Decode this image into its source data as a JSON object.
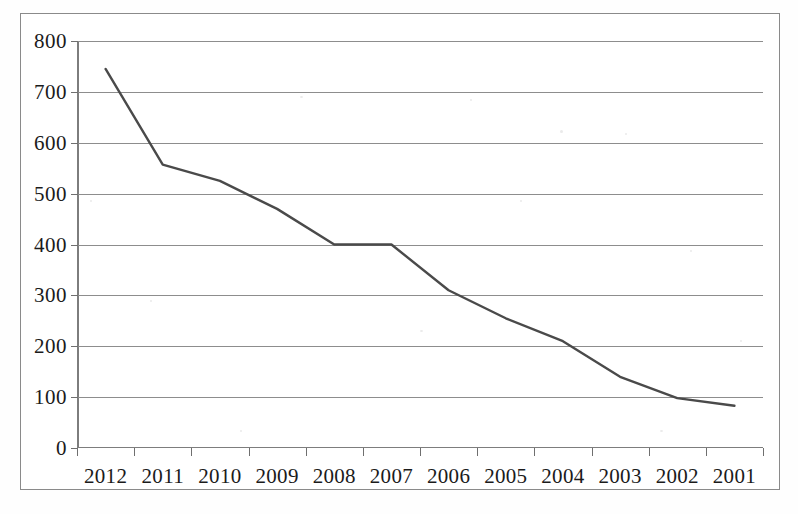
{
  "chart_data": {
    "type": "line",
    "title": "",
    "subtitle": "",
    "xlabel": "",
    "ylabel": "",
    "categories": [
      "2012",
      "2011",
      "2010",
      "2009",
      "2008",
      "2007",
      "2006",
      "2005",
      "2004",
      "2003",
      "2002",
      "2001"
    ],
    "values": [
      745,
      557,
      525,
      470,
      400,
      400,
      310,
      255,
      210,
      140,
      98,
      83
    ],
    "series": [
      {
        "name": "",
        "values": [
          745,
          557,
          525,
          470,
          400,
          400,
          310,
          255,
          210,
          140,
          98,
          83
        ]
      }
    ],
    "ylim": [
      0,
      800
    ],
    "ytick_values": [
      800,
      700,
      600,
      500,
      400,
      300,
      200,
      100,
      0
    ],
    "ytick_labels": [
      "800",
      "700",
      "600",
      "500",
      "400",
      "300",
      "200",
      "100",
      "0"
    ],
    "xtick_labels": [
      "2012",
      "2011",
      "2010",
      "2009",
      "2008",
      "2007",
      "2006",
      "2005",
      "2004",
      "2003",
      "2002",
      "2001"
    ],
    "grid": true,
    "grid_axis": "y",
    "legend": false,
    "legend_position": "none",
    "line_color": "#4a4a4a",
    "grid_color": "#8d8d8d",
    "axis_color": "#7d7d7d",
    "background_color": "#ffffff",
    "frame_color": "#8a8a8a",
    "annotations": []
  }
}
